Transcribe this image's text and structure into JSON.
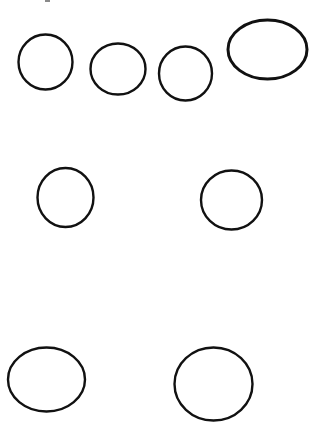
{
  "figure": {
    "background_color": "#ffffff",
    "stroke_color": "#111111",
    "shapes": [
      {
        "id": "oval-1",
        "kind": "circle",
        "row": 1,
        "position": "top-left"
      },
      {
        "id": "oval-2",
        "kind": "circle",
        "row": 1,
        "position": "top-center-left"
      },
      {
        "id": "oval-3",
        "kind": "circle",
        "row": 1,
        "position": "top-center-right"
      },
      {
        "id": "oval-4",
        "kind": "ellipse",
        "row": 1,
        "position": "top-right"
      },
      {
        "id": "oval-5",
        "kind": "circle",
        "row": 2,
        "position": "middle-left"
      },
      {
        "id": "oval-6",
        "kind": "circle",
        "row": 2,
        "position": "middle-right"
      },
      {
        "id": "oval-7",
        "kind": "ellipse",
        "row": 3,
        "position": "bottom-left"
      },
      {
        "id": "oval-8",
        "kind": "ellipse",
        "row": 3,
        "position": "bottom-center"
      }
    ],
    "shape_count": 8
  }
}
